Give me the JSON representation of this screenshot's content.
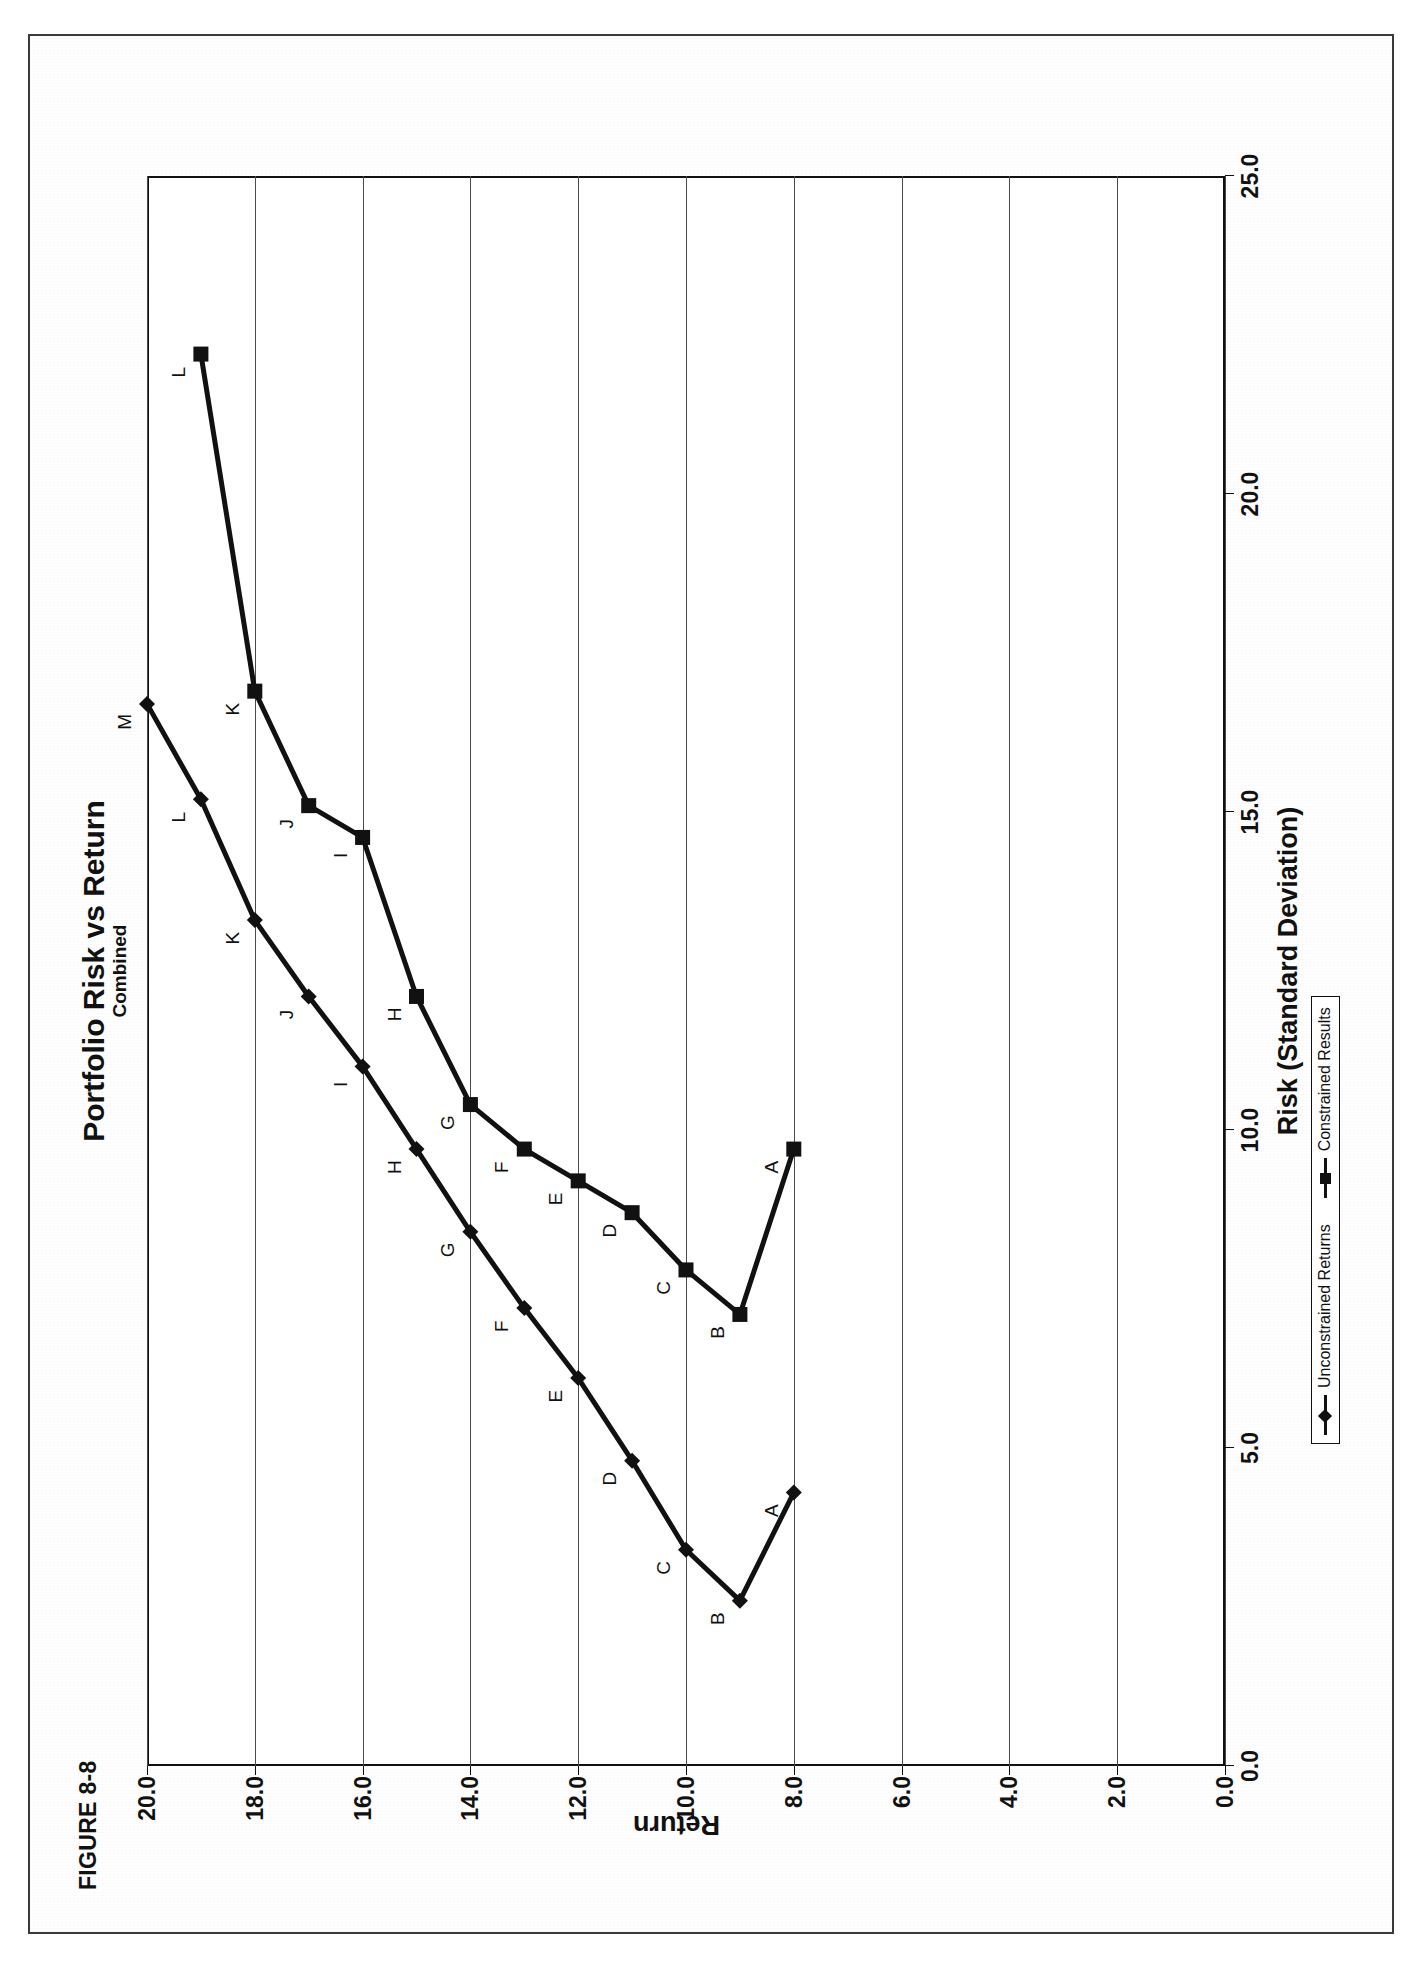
{
  "page": {
    "figure_label": "FIGURE 8-8"
  },
  "chart_data": {
    "type": "line",
    "title": "Portfolio Risk vs Return",
    "subtitle": "Combined",
    "xlabel": "Risk (Standard Deviation)",
    "ylabel": "Return",
    "xlim": [
      0.0,
      25.0
    ],
    "ylim": [
      0.0,
      20.0
    ],
    "xticks": [
      "0.0",
      "5.0",
      "10.0",
      "15.0",
      "20.0",
      "25.0"
    ],
    "xtick_values": [
      0.0,
      5.0,
      10.0,
      15.0,
      20.0,
      25.0
    ],
    "yticks": [
      "0.0",
      "2.0",
      "4.0",
      "6.0",
      "8.0",
      "10.0",
      "12.0",
      "14.0",
      "16.0",
      "18.0",
      "20.0"
    ],
    "ytick_values": [
      0.0,
      2.0,
      4.0,
      6.0,
      8.0,
      10.0,
      12.0,
      14.0,
      16.0,
      18.0,
      20.0
    ],
    "grid": "y-major-only",
    "legend_position": "bottom-center",
    "point_labels": [
      "A",
      "B",
      "C",
      "D",
      "E",
      "F",
      "G",
      "H",
      "I",
      "J",
      "K",
      "L",
      "M"
    ],
    "series": [
      {
        "name": "Unconstrained Returns",
        "marker": "diamond",
        "color": "#111111",
        "points": [
          {
            "label": "A",
            "x": 4.3,
            "y": 8.0
          },
          {
            "label": "B",
            "x": 2.6,
            "y": 9.0
          },
          {
            "label": "C",
            "x": 3.4,
            "y": 10.0
          },
          {
            "label": "D",
            "x": 4.8,
            "y": 11.0
          },
          {
            "label": "E",
            "x": 6.1,
            "y": 12.0
          },
          {
            "label": "F",
            "x": 7.2,
            "y": 13.0
          },
          {
            "label": "G",
            "x": 8.4,
            "y": 14.0
          },
          {
            "label": "H",
            "x": 9.7,
            "y": 15.0
          },
          {
            "label": "I",
            "x": 11.0,
            "y": 16.0
          },
          {
            "label": "J",
            "x": 12.1,
            "y": 17.0
          },
          {
            "label": "K",
            "x": 13.3,
            "y": 18.0
          },
          {
            "label": "L",
            "x": 15.2,
            "y": 19.0
          },
          {
            "label": "M",
            "x": 16.7,
            "y": 20.0
          }
        ]
      },
      {
        "name": "Constrained Results",
        "marker": "square",
        "color": "#111111",
        "points": [
          {
            "label": "A",
            "x": 9.7,
            "y": 8.0
          },
          {
            "label": "B",
            "x": 7.1,
            "y": 9.0
          },
          {
            "label": "C",
            "x": 7.8,
            "y": 10.0
          },
          {
            "label": "D",
            "x": 8.7,
            "y": 11.0
          },
          {
            "label": "E",
            "x": 9.2,
            "y": 12.0
          },
          {
            "label": "F",
            "x": 9.7,
            "y": 13.0
          },
          {
            "label": "G",
            "x": 10.4,
            "y": 14.0
          },
          {
            "label": "H",
            "x": 12.1,
            "y": 15.0
          },
          {
            "label": "I",
            "x": 14.6,
            "y": 16.0
          },
          {
            "label": "J",
            "x": 15.1,
            "y": 17.0
          },
          {
            "label": "K",
            "x": 16.9,
            "y": 18.0
          },
          {
            "label": "L",
            "x": 22.2,
            "y": 19.0
          }
        ]
      }
    ]
  },
  "legend": {
    "items": [
      {
        "label": "Unconstrained Returns",
        "marker": "diamond"
      },
      {
        "label": "Constrained Results",
        "marker": "square"
      }
    ]
  }
}
